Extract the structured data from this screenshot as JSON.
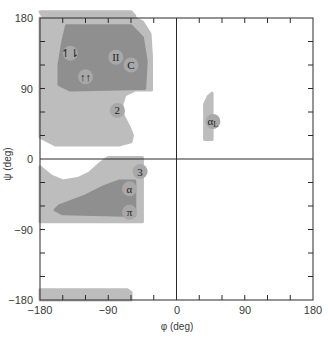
{
  "chart_data": {
    "type": "scatter",
    "title": "",
    "xlabel": "φ (deg)",
    "ylabel": "ψ (deg)",
    "xlim": [
      -180,
      180
    ],
    "ylim": [
      -180,
      180
    ],
    "x_ticks": [
      -180,
      -90,
      0,
      90,
      180
    ],
    "y_ticks": [
      -180,
      -90,
      0,
      90,
      180
    ],
    "minor_tick_step": 30,
    "grid": false,
    "zero_lines": true,
    "colors": {
      "allowed_region": "#bdbdbd",
      "favorable_region": "#8f8f8f",
      "label_circle": "#a8a8a8",
      "axis": "#2a2a2a"
    },
    "regions": [
      {
        "name": "beta_allowed",
        "level": "allowed",
        "polygon": [
          [
            -180,
            180
          ],
          [
            -180,
            178
          ],
          [
            -180,
            175
          ],
          [
            -175,
            180
          ],
          [
            -180,
            188
          ],
          [
            -175,
            188
          ],
          [
            -60,
            188
          ],
          [
            -55,
            183
          ],
          [
            -55,
            180
          ],
          [
            -45,
            175
          ],
          [
            -35,
            160
          ],
          [
            -33,
            130
          ],
          [
            -33,
            88
          ],
          [
            -55,
            88
          ],
          [
            -68,
            82
          ],
          [
            -72,
            70
          ],
          [
            -70,
            55
          ],
          [
            -62,
            40
          ],
          [
            -58,
            30
          ],
          [
            -60,
            22
          ],
          [
            -75,
            18
          ],
          [
            -160,
            18
          ],
          [
            -180,
            28
          ]
        ]
      },
      {
        "name": "beta_favorable",
        "level": "favorable",
        "polygon": [
          [
            -145,
            170
          ],
          [
            -60,
            170
          ],
          [
            -45,
            155
          ],
          [
            -40,
            125
          ],
          [
            -42,
            90
          ],
          [
            -140,
            88
          ],
          [
            -155,
            95
          ],
          [
            -155,
            120
          ],
          [
            -150,
            150
          ]
        ]
      },
      {
        "name": "alpha_allowed",
        "level": "allowed",
        "polygon": [
          [
            -180,
            -10
          ],
          [
            -165,
            -22
          ],
          [
            -150,
            -28
          ],
          [
            -130,
            -25
          ],
          [
            -115,
            -18
          ],
          [
            -100,
            -5
          ],
          [
            -90,
            2
          ],
          [
            -45,
            2
          ],
          [
            -45,
            -80
          ],
          [
            -180,
            -80
          ]
        ]
      },
      {
        "name": "alpha_favorable",
        "level": "favorable",
        "polygon": [
          [
            -155,
            -60
          ],
          [
            -120,
            -47
          ],
          [
            -95,
            -35
          ],
          [
            -75,
            -28
          ],
          [
            -55,
            -28
          ],
          [
            -55,
            -72
          ],
          [
            -150,
            -70
          ],
          [
            -160,
            -65
          ]
        ]
      },
      {
        "name": "alpha_L",
        "level": "allowed",
        "polygon": [
          [
            37,
            70
          ],
          [
            42,
            80
          ],
          [
            47,
            84
          ],
          [
            47,
            25
          ],
          [
            37,
            25
          ]
        ]
      },
      {
        "name": "bottom_edge",
        "level": "allowed",
        "polygon": [
          [
            -180,
            -180
          ],
          [
            -180,
            -167
          ],
          [
            -65,
            -167
          ],
          [
            -60,
            -170
          ],
          [
            -60,
            -180
          ]
        ]
      }
    ],
    "annotations": [
      {
        "label": "↿⇂",
        "name": "antiparallel-beta-sheet",
        "phi": -140,
        "psi": 135
      },
      {
        "label": "II",
        "name": "polyproline-II-helix",
        "phi": -80,
        "psi": 130
      },
      {
        "label": "C",
        "name": "collagen-helix",
        "phi": -60,
        "psi": 120
      },
      {
        "label": "↑↑",
        "name": "parallel-beta-sheet",
        "phi": -120,
        "psi": 105
      },
      {
        "label": "2",
        "name": "2-7-ribbon",
        "phi": -78,
        "psi": 62
      },
      {
        "label": "3",
        "name": "3-10-helix",
        "phi": -48,
        "psi": -16
      },
      {
        "label": "α",
        "name": "right-handed-alpha-helix",
        "phi": -62,
        "psi": -38
      },
      {
        "label": "π",
        "name": "pi-helix",
        "phi": -62,
        "psi": -68
      },
      {
        "label": "αL",
        "name": "left-handed-alpha-helix",
        "phi": 48,
        "psi": 48
      }
    ]
  },
  "labels": {
    "x_axis_title": "φ (deg)",
    "y_axis_title": "ψ (deg)",
    "x_tick_labels": [
      "−180",
      "−90",
      "0",
      "90",
      "180"
    ],
    "y_tick_labels": [
      "180",
      "90",
      "0",
      "−90",
      "−180"
    ]
  }
}
